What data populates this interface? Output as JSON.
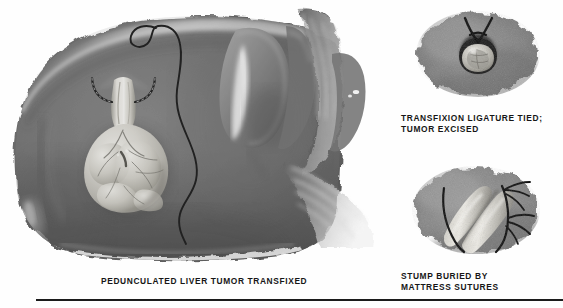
{
  "plate": {
    "title": "Pedunculated Liver Tumor Transfixed",
    "background_color": "#ffffff",
    "rule_color": "#1b1b1b"
  },
  "captions": {
    "main": "PEDUNCULATED LIVER TUMOR TRANSFIXED",
    "top_right": "TRANSFIXION LIGATURE TIED;\nTUMOR EXCISED",
    "bottom_right": "STUMP BURIED BY\nMATTRESS SUTURES"
  },
  "figures": {
    "main": {
      "name": "pedunculated-liver-tumor-transfixed",
      "structures": [
        "liver",
        "liver-superior-edge-highlight",
        "pedunculated-tumor",
        "tumor-pedicle",
        "transfixion-needle-arcs",
        "suture-thread",
        "gallbladder",
        "falciform-ligament",
        "omental-fibrous-strands"
      ],
      "liver_color": "#6e6e6e",
      "liver_shadow_color": "#4a4a4a",
      "tumor_color": "#d8d6cf",
      "gallbladder_color": "#7b7b7b",
      "suture_color": "#0d0d0d"
    },
    "top_right": {
      "name": "transfixion-ligature-tied-tumor-excised",
      "structures": [
        "liver-surface-patch",
        "ligature-knot",
        "ligature-thread-tails",
        "excised-tumor-stump"
      ],
      "patch_color": "#848484",
      "stump_color": "#cfcdc6",
      "thread_color": "#101010"
    },
    "bottom_right": {
      "name": "stump-buried-by-mattress-sutures",
      "structures": [
        "liver-surface-patch",
        "buried-stump-ridge-left",
        "buried-stump-ridge-right",
        "mattress-suture-upper",
        "mattress-suture-lower"
      ],
      "patch_color": "#8a8a8a",
      "ridge_color": "#c8c6bf",
      "thread_color": "#101010"
    }
  }
}
